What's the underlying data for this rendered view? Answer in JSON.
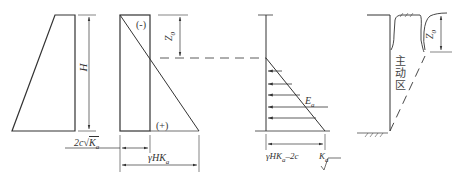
{
  "figure": {
    "panels": [
      {
        "id": "self-weight-pressure",
        "labels": {
          "height": "H",
          "cohesion_term": "2c√Ka"
        }
      },
      {
        "id": "combined-pressure",
        "labels": {
          "negative": "(-)",
          "positive": "(+)",
          "crack_depth": "Z0",
          "bottom_width": "γHKa"
        }
      },
      {
        "id": "net-pressure",
        "labels": {
          "resultant": "Ea",
          "bottom_value_a": "γHKa−2c",
          "bottom_value_b": "Ka"
        }
      },
      {
        "id": "wall-active-zone",
        "labels": {
          "crack_depth": "Z0",
          "zone": "主动区"
        }
      }
    ]
  },
  "labels": {
    "H": "H",
    "two_c": "2c",
    "Ka_K": "K",
    "Ka_sub": "a",
    "minus": "(-)",
    "plus": "(+)",
    "Z": "Z",
    "zero": "0",
    "gammaHK": "γHK",
    "E": "E",
    "Ea_sub": "a",
    "gammaHK_2c_pre": "γHK",
    "gammaHK_2c_post": "–2c",
    "K2": "K",
    "zone_chars": [
      "主",
      "动",
      "区"
    ]
  },
  "colors": {
    "stroke": "#333333",
    "background": "#ffffff"
  }
}
